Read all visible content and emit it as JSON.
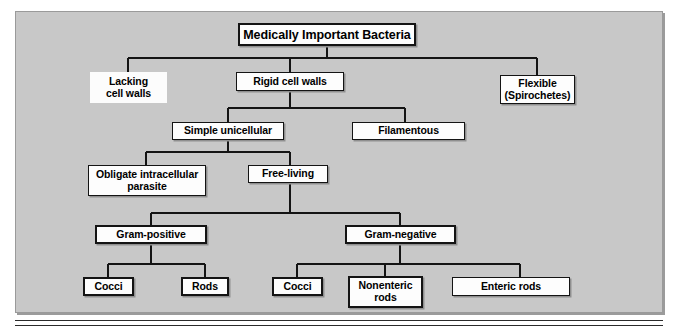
{
  "figure": {
    "kind": "hierarchy-flowchart",
    "title": "Medically Important Bacteria",
    "panel_color": "#c8c8c8",
    "node_fill": "#fdfdfd",
    "line_color": "#141414",
    "text_color": "#000000"
  },
  "nodes": {
    "root": {
      "label": "Medically Important Bacteria"
    },
    "lacking_cell_walls": {
      "label": "Lacking\ncell walls",
      "line1": "Lacking",
      "line2": "cell walls"
    },
    "rigid_cell_walls": {
      "label": "Rigid cell walls"
    },
    "flexible": {
      "label": "Flexible\n(Spirochetes)",
      "line1": "Flexible",
      "line2": "(Spirochetes)"
    },
    "simple_unicellular": {
      "label": "Simple unicellular"
    },
    "filamentous": {
      "label": "Filamentous"
    },
    "obligate_intracellular": {
      "label": "Obligate intracellular\nparasite",
      "line1": "Obligate intracellular",
      "line2": "parasite"
    },
    "free_living": {
      "label": "Free-living"
    },
    "gram_positive": {
      "label": "Gram-positive"
    },
    "gram_negative": {
      "label": "Gram-negative"
    },
    "gp_cocci": {
      "label": "Cocci"
    },
    "gp_rods": {
      "label": "Rods"
    },
    "gn_cocci": {
      "label": "Cocci"
    },
    "gn_nonenteric_rods": {
      "label": "Nonenteric\nrods",
      "line1": "Nonenteric",
      "line2": "rods"
    },
    "gn_enteric_rods": {
      "label": "Enteric rods"
    }
  },
  "edges": [
    {
      "from": "root",
      "to": "lacking_cell_walls"
    },
    {
      "from": "root",
      "to": "rigid_cell_walls"
    },
    {
      "from": "root",
      "to": "flexible"
    },
    {
      "from": "rigid_cell_walls",
      "to": "simple_unicellular"
    },
    {
      "from": "rigid_cell_walls",
      "to": "filamentous"
    },
    {
      "from": "simple_unicellular",
      "to": "obligate_intracellular"
    },
    {
      "from": "simple_unicellular",
      "to": "free_living"
    },
    {
      "from": "free_living",
      "to": "gram_positive"
    },
    {
      "from": "free_living",
      "to": "gram_negative"
    },
    {
      "from": "gram_positive",
      "to": "gp_cocci"
    },
    {
      "from": "gram_positive",
      "to": "gp_rods"
    },
    {
      "from": "gram_negative",
      "to": "gn_cocci"
    },
    {
      "from": "gram_negative",
      "to": "gn_nonenteric_rods"
    },
    {
      "from": "gram_negative",
      "to": "gn_enteric_rods"
    }
  ]
}
